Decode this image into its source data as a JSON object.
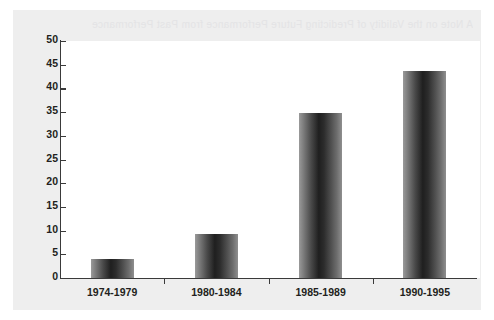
{
  "figure": {
    "background_color": "#eeeeee",
    "plot_background_color": "#ffffff",
    "axis_color": "#3a3a3a",
    "bar_color_dark": "#1f1f1f",
    "bar_color_light": "#9a9a9a",
    "scan_artifact_text": "A Note on the Validity of Predicting Future Performance from Past Performance"
  },
  "chart_data": {
    "type": "bar",
    "title": "",
    "subtitle": "",
    "xlabel": "",
    "ylabel": "",
    "categories": [
      "1974-1979",
      "1980-1984",
      "1985-1989",
      "1990-1995"
    ],
    "values": [
      4,
      9.2,
      34.8,
      43.7
    ],
    "series": [
      {
        "name": "",
        "values": [
          4,
          9.2,
          34.8,
          43.7
        ]
      }
    ],
    "ylim": [
      0,
      50
    ],
    "yticks": [
      0,
      5,
      10,
      15,
      20,
      25,
      30,
      35,
      40,
      45,
      50
    ],
    "ytick_labels": [
      "0",
      "5",
      "10",
      "15",
      "20",
      "25",
      "30",
      "35",
      "40",
      "45",
      "50"
    ],
    "grid": false,
    "legend": null,
    "legend_position": "none",
    "annotations": []
  }
}
